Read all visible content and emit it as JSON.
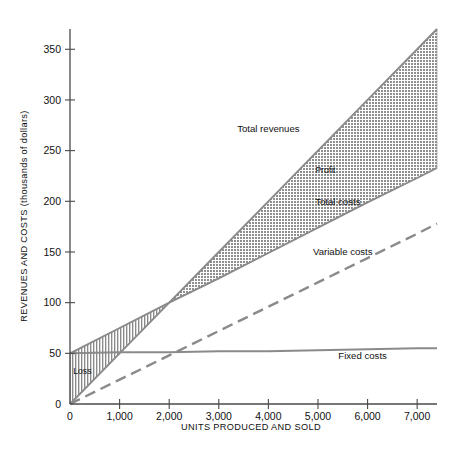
{
  "chart_data": {
    "type": "line",
    "title": "",
    "xlabel": "UNITS PRODUCED AND SOLD",
    "ylabel": "REVENUES AND COSTS (thousands of dollars)",
    "xlim": [
      0,
      7400
    ],
    "ylim": [
      0,
      370
    ],
    "grid": false,
    "legend_position": "inline-annotations",
    "xticks": [
      0,
      1000,
      2000,
      3000,
      4000,
      5000,
      6000,
      7000
    ],
    "xticklabels": [
      "0",
      "1,000",
      "2,000",
      "3,000",
      "4,000",
      "5,000",
      "6,000",
      "7,000"
    ],
    "yticks": [
      0,
      50,
      100,
      150,
      200,
      250,
      300,
      350
    ],
    "yticklabels": [
      "0",
      "50",
      "100",
      "150",
      "200",
      "250",
      "300",
      "350"
    ],
    "x": [
      0,
      1000,
      2000,
      3000,
      4000,
      5000,
      6000,
      7000,
      7400
    ],
    "series": [
      {
        "name": "Total revenues",
        "style": "solid",
        "values": [
          0,
          50,
          100,
          150,
          200,
          250,
          300,
          350,
          370
        ]
      },
      {
        "name": "Total costs",
        "style": "solid",
        "values": [
          50,
          75,
          100,
          124,
          149,
          174,
          199,
          223,
          233
        ]
      },
      {
        "name": "Variable costs",
        "style": "dashed",
        "values": [
          0,
          24,
          48,
          72,
          96,
          120,
          144,
          168,
          178
        ]
      },
      {
        "name": "Fixed costs",
        "style": "solid",
        "values": [
          50,
          51,
          51,
          52,
          52,
          53,
          54,
          55,
          55
        ]
      }
    ],
    "regions": [
      {
        "name": "Profit",
        "label": "Profit",
        "fill": "dotted-gray",
        "between": [
          "Total revenues",
          "Total costs"
        ],
        "from_x": 1950,
        "to_x": 7400
      },
      {
        "name": "Loss",
        "label": "Loss",
        "fill": "vertical-hatch",
        "between": [
          "Total costs",
          "Total revenues"
        ],
        "from_x": 0,
        "to_x": 1950
      }
    ],
    "annotations": [
      {
        "text": "Total revenues",
        "x": 4000,
        "y": 268
      },
      {
        "text": "Profit",
        "x": 5150,
        "y": 228
      },
      {
        "text": "Total costs",
        "x": 5400,
        "y": 196
      },
      {
        "text": "Variable costs",
        "x": 5500,
        "y": 147
      },
      {
        "text": "Fixed costs",
        "x": 5900,
        "y": 44
      },
      {
        "text": "Loss",
        "x": 250,
        "y": 30
      }
    ],
    "break_even": {
      "x": 1950,
      "y": 100
    }
  },
  "colors": {
    "axis": "#4a4a4a",
    "line": "#8a8a8a",
    "profit_fill": "#9a9a9a",
    "loss_fill": "#9a9a9a",
    "text": "#111111",
    "background": "#ffffff"
  }
}
